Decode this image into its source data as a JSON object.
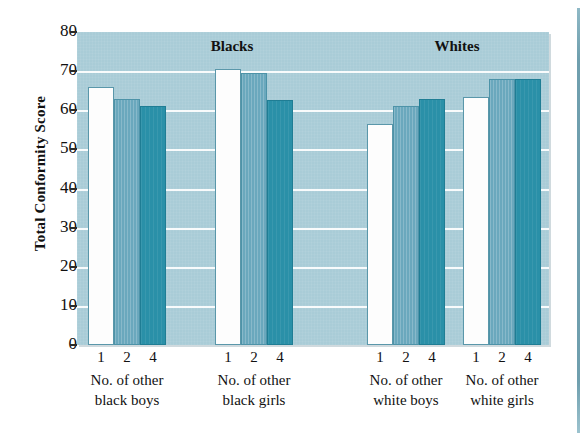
{
  "chart_data": {
    "type": "bar",
    "title": "",
    "xlabel": "",
    "ylabel": "Total Conformity Score",
    "ylim": [
      0,
      80
    ],
    "ytick_values": [
      80,
      70,
      60,
      50,
      40,
      30,
      20,
      10,
      0
    ],
    "ytick_labels": [
      "80",
      "70",
      "60",
      "50",
      "40",
      "30",
      "20",
      "10",
      "0"
    ],
    "grid": true,
    "legend": "none",
    "panels": [
      {
        "label": "Blacks"
      },
      {
        "label": "Whites"
      }
    ],
    "categories": [
      "1",
      "2",
      "4"
    ],
    "groups": [
      {
        "panel": "Blacks",
        "caption_line1": "No. of other",
        "caption_line2": "black boys",
        "tick_labels": [
          "1",
          "2",
          "4"
        ],
        "values": [
          66,
          63,
          61
        ],
        "styles": [
          "white",
          "mid",
          "dark"
        ]
      },
      {
        "panel": "Blacks",
        "caption_line1": "No. of other",
        "caption_line2": "black girls",
        "tick_labels": [
          "1",
          "2",
          "4"
        ],
        "values": [
          70.5,
          69.5,
          62.5
        ],
        "styles": [
          "white",
          "mid",
          "dark"
        ]
      },
      {
        "panel": "Whites",
        "caption_line1": "No. of other",
        "caption_line2": "white boys",
        "tick_labels": [
          "1",
          "2",
          "4"
        ],
        "values": [
          56.5,
          61,
          63
        ],
        "styles": [
          "white",
          "mid",
          "dark"
        ]
      },
      {
        "panel": "Whites",
        "caption_line1": "No. of other",
        "caption_line2": "white girls",
        "tick_labels": [
          "1",
          "2",
          "4"
        ],
        "values": [
          63.5,
          68,
          68
        ],
        "styles": [
          "white",
          "mid",
          "dark"
        ]
      }
    ],
    "colors": {
      "plot_background": "#a9ccd7",
      "gridline": "#ffffff",
      "bar_white": "#fdfdfd",
      "bar_mid": "#6aa8bd",
      "bar_dark": "#2a90a8",
      "text": "#111111",
      "page_rule": "#6f9fae"
    }
  }
}
